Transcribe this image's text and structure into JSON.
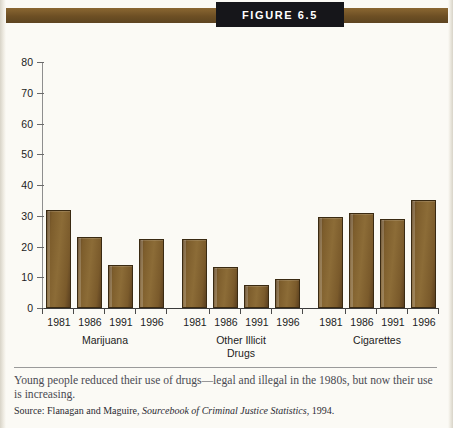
{
  "figure": {
    "badge_label": "Figure 6.5",
    "caption": "Young people reduced their use of drugs—legal and illegal in the 1980s, but now their use is increasing.",
    "source": "Source: Flanagan and Maguire, ",
    "source_italic": "Sourcebook of Criminal Justice Statistics",
    "source_tail": ", 1994."
  },
  "colors": {
    "bar_dark": "#5e4220",
    "bar_light": "#8c6c37",
    "band": "#6d4f24",
    "badge_bg": "#16161a",
    "page_bg": "#fbfaf5"
  },
  "chart_data": {
    "type": "bar",
    "title": "Figure 6.5",
    "xlabel": "",
    "ylabel": "",
    "ylim": [
      0,
      80
    ],
    "yticks": [
      0,
      10,
      20,
      30,
      40,
      50,
      60,
      70,
      80
    ],
    "ytick_labels": [
      "0",
      "10",
      "20",
      "30",
      "40",
      "50",
      "60",
      "70",
      "80"
    ],
    "grid": false,
    "legend": "none",
    "categories": [
      "1981",
      "1986",
      "1991",
      "1996"
    ],
    "groups": [
      {
        "name": "Marijuana",
        "values": [
          32,
          23,
          14,
          22.5
        ],
        "x_labels": [
          "1981",
          "1986",
          "1991",
          "1996"
        ]
      },
      {
        "name": "Other Illicit Drugs",
        "name_lines": [
          "Other Illicit",
          "Drugs"
        ],
        "values": [
          22.5,
          13.5,
          7.5,
          9.5
        ],
        "x_labels": [
          "1981",
          "1986",
          "1991",
          "1996"
        ]
      },
      {
        "name": "Cigarettes",
        "name_lines": [
          "Cigarettes"
        ],
        "values": [
          29.5,
          31,
          29,
          35
        ],
        "x_labels": [
          "1981",
          "1986",
          "1991",
          "1996"
        ]
      }
    ]
  }
}
